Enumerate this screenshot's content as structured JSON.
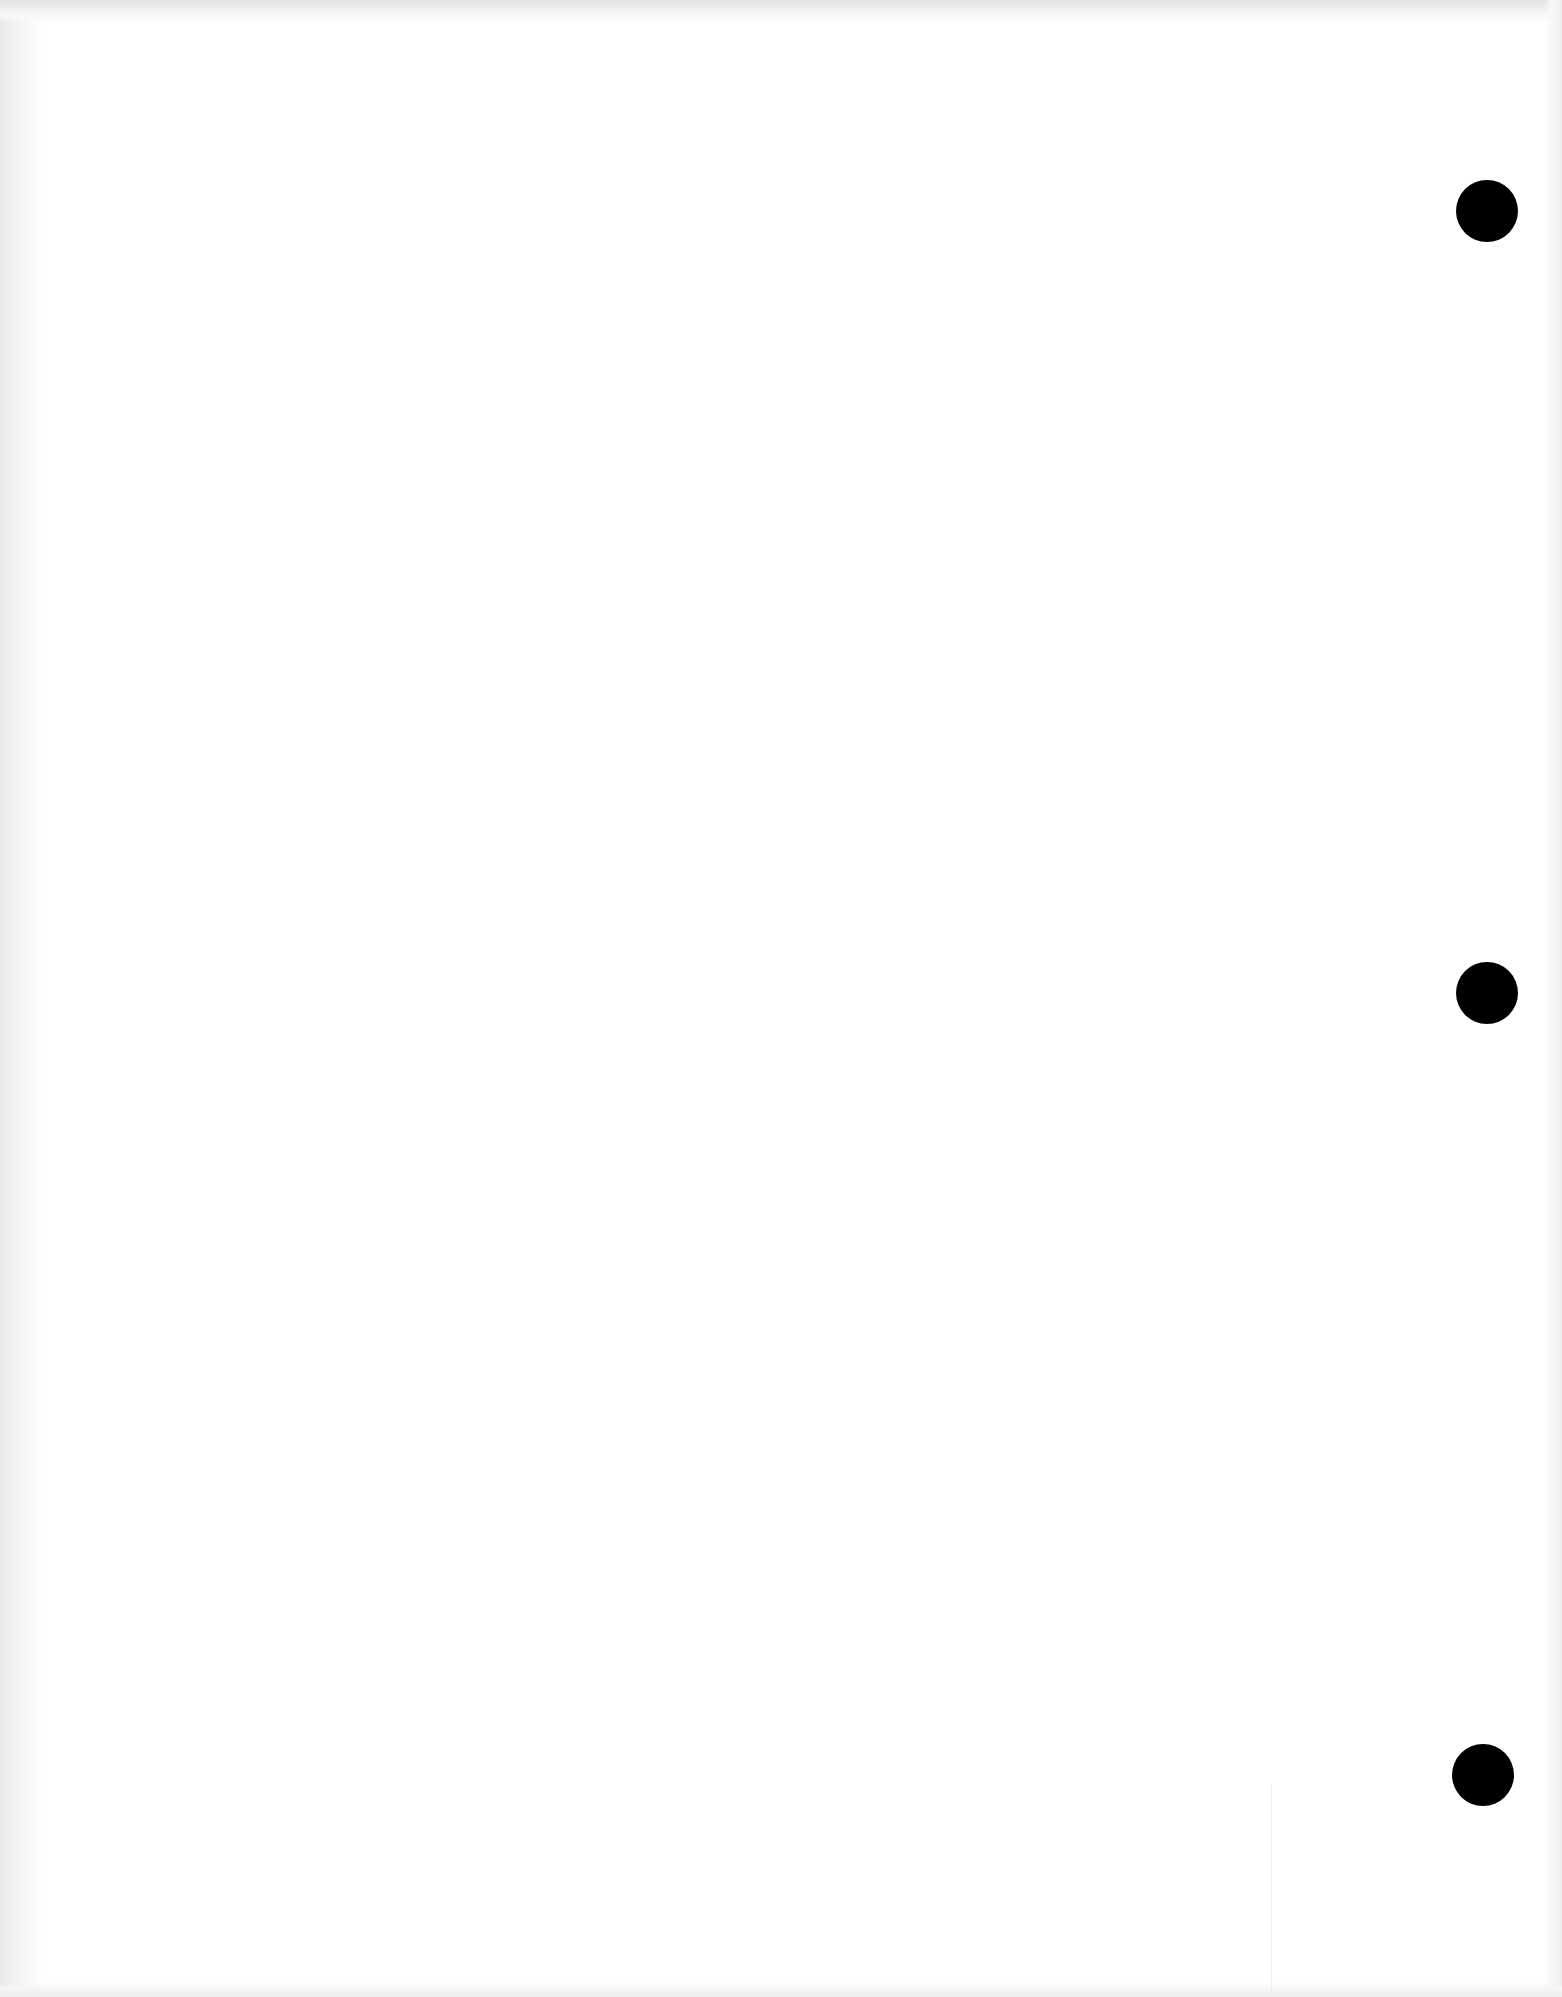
{
  "document": {
    "type": "blank three-hole-punched sheet",
    "background_color": "#ffffff",
    "text_content": ""
  },
  "punch_holes": [
    {
      "id": "top",
      "cx": 1487,
      "cy": 211,
      "diameter": 62,
      "color": "#000000"
    },
    {
      "id": "middle",
      "cx": 1487,
      "cy": 993,
      "diameter": 62,
      "color": "#000000"
    },
    {
      "id": "bottom",
      "cx": 1483,
      "cy": 1775,
      "diameter": 62,
      "color": "#000000"
    }
  ]
}
